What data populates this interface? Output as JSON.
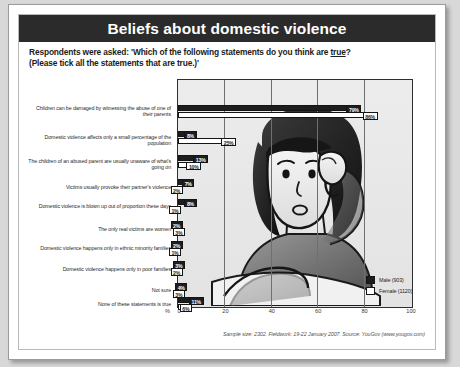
{
  "title": "Beliefs about domestic violence",
  "question": {
    "line1_pre": "Respondents were asked: 'Which of the following statements do you think are ",
    "line1_underlined": "true",
    "line1_post": "?",
    "line2": "(Please tick all the statements that are true.)'"
  },
  "legend": {
    "male_label": "Male (903)",
    "female_label": "Female (1120)",
    "male_color": "#1d1d1d",
    "female_color": "#ffffff"
  },
  "axis": {
    "unit": "%",
    "ticks": [
      "0",
      "20",
      "40",
      "60",
      "80",
      "100"
    ]
  },
  "footer": "Sample size: 2302. Fieldwork: 19-22 January 2007. Source: YouGov (www.yougov.com)",
  "illustration_name": "distressed-woman-illustration",
  "chart_data": {
    "type": "bar",
    "orientation": "horizontal",
    "title": "Beliefs about domestic violence",
    "xlabel": "%",
    "ylabel": "",
    "xlim": [
      0,
      100
    ],
    "grid": true,
    "legend_position": "inside-right",
    "categories": [
      "Children can be damaged by witnessing the abuse of one of their parents",
      "Domestic violence affects only a small percentage of the population",
      "The children of an abused parent are usually unaware of what's going on",
      "Victims usually provoke their partner's violence",
      "Domestic violence is blown up out of proportion these days",
      "The only real victims are women",
      "Domestic violence happens only in ethnic minority families",
      "Domestic violence happens only in poor families",
      "Not sure",
      "None of these statements is true"
    ],
    "series": [
      {
        "name": "Male (903)",
        "values": [
          79,
          8,
          13,
          7,
          8,
          2,
          2,
          3,
          4,
          11
        ]
      },
      {
        "name": "Female (1120)",
        "values": [
          86,
          25,
          10,
          2,
          1,
          3,
          1,
          2,
          3,
          6
        ]
      }
    ],
    "value_labels": [
      {
        "male": "79%",
        "female": "86%"
      },
      {
        "male": "8%",
        "female": "25%"
      },
      {
        "male": "13%",
        "female": "10%"
      },
      {
        "male": "7%",
        "female": "2%"
      },
      {
        "male": "8%",
        "female": "1%"
      },
      {
        "male": "2%",
        "female": "3%"
      },
      {
        "male": "2%",
        "female": "1%"
      },
      {
        "male": "3%",
        "female": "2%"
      },
      {
        "male": "4%",
        "female": "3%"
      },
      {
        "male": "11%",
        "female": "6%"
      }
    ]
  }
}
